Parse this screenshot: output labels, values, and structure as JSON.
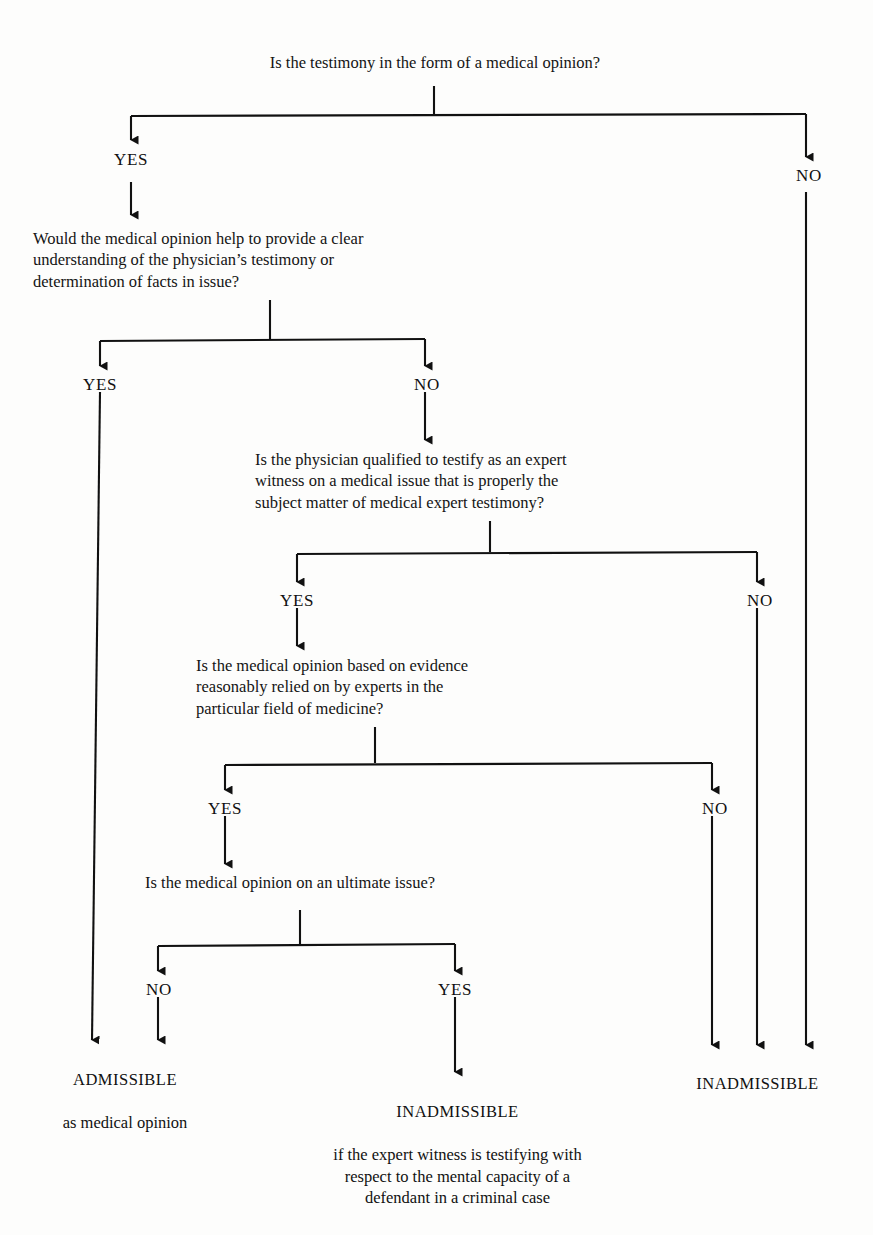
{
  "diagram": {
    "line_color": "#111111",
    "text_color": "#141414",
    "background": "#fdfdfc"
  },
  "questions": [
    {
      "id": "q1",
      "text": "Is the testimony in the form of a medical opinion?"
    },
    {
      "id": "q2",
      "text": "Would the medical opinion help to provide a clear\nunderstanding of the physician’s testimony or\ndetermination of facts in issue?"
    },
    {
      "id": "q3",
      "text": "Is the physician qualified to testify as an expert\nwitness on a medical issue that is properly the\nsubject matter of medical expert testimony?"
    },
    {
      "id": "q4",
      "text": "Is the medical opinion based on evidence\nreasonably relied on by experts in the\nparticular field of medicine?"
    },
    {
      "id": "q5",
      "text": "Is the medical opinion on an ultimate issue?"
    }
  ],
  "branch_labels": {
    "q1_yes": "YES",
    "q1_no": "NO",
    "q2_yes": "YES",
    "q2_no": "NO",
    "q3_yes": "YES",
    "q3_no": "NO",
    "q4_yes": "YES",
    "q4_no": "NO",
    "q5_no": "NO",
    "q5_yes": "YES"
  },
  "outcomes": [
    {
      "id": "admissible",
      "head": "ADMISSIBLE",
      "sub": "as medical opinion"
    },
    {
      "id": "inadmissible_center",
      "head": "INADMISSIBLE",
      "sub": "if the expert witness is testifying with\nrespect to the mental capacity of a\ndefendant in a criminal case"
    },
    {
      "id": "inadmissible_right",
      "head": "INADMISSIBLE",
      "sub": ""
    }
  ]
}
